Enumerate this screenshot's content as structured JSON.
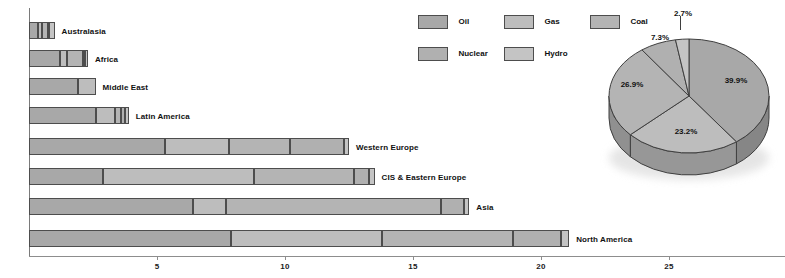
{
  "legend": {
    "items": [
      {
        "label": "Oil",
        "color": "#a8a8a8"
      },
      {
        "label": "Gas",
        "color": "#bdbdbd"
      },
      {
        "label": "Coal",
        "color": "#b4b4b4"
      },
      {
        "label": "Nuclear",
        "color": "#b0b0b0"
      },
      {
        "label": "Hydro",
        "color": "#c4c4c4"
      }
    ]
  },
  "axis": {
    "ticks": [
      {
        "label": "5",
        "value": 5
      },
      {
        "label": "10",
        "value": 10
      },
      {
        "label": "15",
        "value": 15
      },
      {
        "label": "20",
        "value": 20
      },
      {
        "label": "25",
        "value": 25
      }
    ]
  },
  "chart_data": [
    {
      "type": "bar",
      "orientation": "horizontal",
      "stacked": true,
      "title": "",
      "xlabel": "",
      "ylabel": "",
      "xlim": [
        0,
        29.5
      ],
      "grid": false,
      "legend_position": "top-center",
      "series": [
        {
          "name": "Oil",
          "values": [
            0.35,
            1.2,
            1.9,
            2.6,
            5.3,
            2.9,
            6.4,
            7.9
          ]
        },
        {
          "name": "Gas",
          "values": [
            0.15,
            0.3,
            0.7,
            0.75,
            2.5,
            5.9,
            1.3,
            5.9
          ]
        },
        {
          "name": "Coal",
          "values": [
            0.25,
            0.6,
            0.0,
            0.25,
            2.4,
            3.9,
            8.4,
            5.1
          ]
        },
        {
          "name": "Nuclear",
          "values": [
            0.05,
            0.1,
            0.0,
            0.15,
            2.1,
            0.6,
            0.9,
            1.9
          ]
        },
        {
          "name": "Hydro",
          "values": [
            0.2,
            0.1,
            0.0,
            0.15,
            0.2,
            0.2,
            0.2,
            0.3
          ]
        }
      ],
      "categories": [
        "Australasia",
        "Africa",
        "Middle East",
        "Latin America",
        "Western Europe",
        "CIS & Eastern Europe",
        "Asia",
        "North America"
      ],
      "totals": [
        1.0,
        2.3,
        2.6,
        3.9,
        12.5,
        13.5,
        17.2,
        21.1
      ]
    },
    {
      "type": "pie",
      "title": "",
      "three_d": true,
      "labels": [
        "Oil",
        "Gas",
        "Coal",
        "Nuclear",
        "Hydro"
      ],
      "values": [
        39.9,
        23.2,
        26.9,
        7.3,
        2.7
      ],
      "data_labels": [
        "39.9%",
        "23.2%",
        "26.9%",
        "7.3%",
        "2.7%"
      ],
      "legend_position": "top-left"
    }
  ]
}
